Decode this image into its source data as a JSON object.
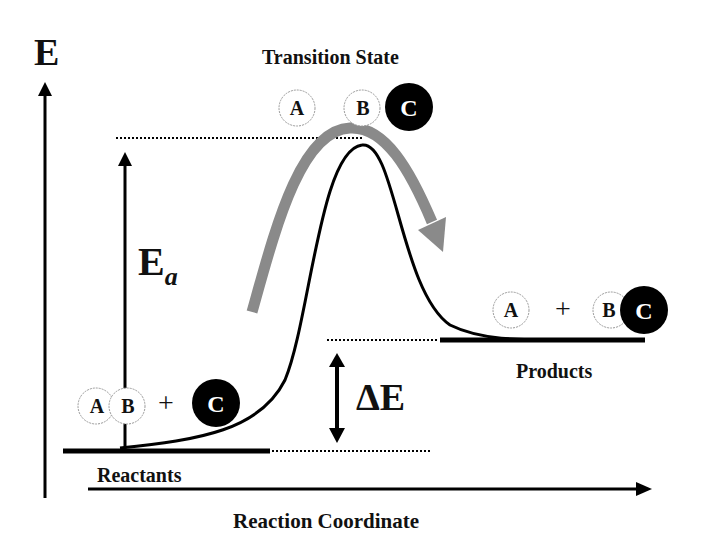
{
  "diagram": {
    "type": "energy-profile",
    "y_axis_label": "E",
    "x_axis_label": "Reaction Coordinate",
    "activation_energy_label": "E",
    "activation_energy_subscript": "a",
    "delta_energy_label": "ΔE",
    "transition_state_label": "Transition State",
    "reactants_label": "Reactants",
    "products_label": "Products",
    "plus_sign": "+",
    "reactants_species": [
      "A",
      "B",
      "C"
    ],
    "transition_species": [
      "A",
      "B",
      "C"
    ],
    "products_species": [
      "A",
      "B",
      "C"
    ],
    "colors": {
      "curve": "#000000",
      "reaction_path_arrow": "#8a8a8a",
      "atom_c_fill": "#000000",
      "atom_ab_fill": "#ffffff"
    }
  }
}
